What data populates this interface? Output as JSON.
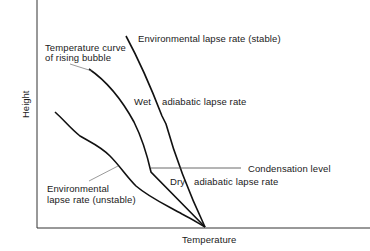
{
  "diagram": {
    "type": "lapse-rate-diagram",
    "axes": {
      "x_label": "Temperature",
      "y_label": "Height"
    },
    "labels": {
      "stable": "Environmental lapse rate (stable)",
      "bubble_line1": "Temperature curve",
      "bubble_line2": "of rising bubble",
      "wet": "Wet",
      "wet_rest": "adiabatic lapse rate",
      "condensation": "Condensation level",
      "dry": "Dry",
      "dry_rest": "adiabatic lapse rate",
      "unstable_line1": "Environmental",
      "unstable_line2": "lapse rate (unstable)"
    },
    "colors": {
      "line": "#111111",
      "leader": "#555555",
      "axis": "#333333"
    }
  }
}
